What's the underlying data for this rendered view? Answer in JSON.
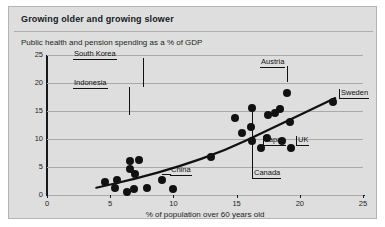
{
  "card": {
    "title": "Growing older and growing slower",
    "subtitle": "Public health and pension spending as a % of GDP",
    "bg_color": "#dedede",
    "ink_color": "#111111"
  },
  "chart_data": {
    "type": "scatter",
    "title": "Growing older and growing slower",
    "subtitle": "Public health and pension spending as a % of GDP",
    "xlabel": "% of population over 60 years old",
    "ylabel": "Public health and pension spending as a % of GDP",
    "xlim": [
      0,
      25
    ],
    "ylim": [
      0,
      25
    ],
    "xticks": [
      "0",
      "5",
      "10",
      "15",
      "20",
      "25"
    ],
    "yticks": [
      "0",
      "5",
      "10",
      "15",
      "20",
      "25"
    ],
    "grid": "horizontal",
    "legend": "none",
    "points": [
      {
        "x": 4.6,
        "y": 2.4
      },
      {
        "x": 5.5,
        "y": 2.6
      },
      {
        "x": 5.4,
        "y": 1.2
      },
      {
        "x": 6.3,
        "y": 0.5
      },
      {
        "x": 6.9,
        "y": 1.1
      },
      {
        "x": 6.6,
        "y": 6.0,
        "label": "South Korea"
      },
      {
        "x": 7.3,
        "y": 6.2
      },
      {
        "x": 6.6,
        "y": 4.6
      },
      {
        "x": 7.0,
        "y": 3.7
      },
      {
        "x": 7.9,
        "y": 1.2
      },
      {
        "x": 9.1,
        "y": 2.6
      },
      {
        "x": 10.0,
        "y": 1.0,
        "label": "China"
      },
      {
        "x": 13.0,
        "y": 6.8
      },
      {
        "x": 16.2,
        "y": 9.6,
        "label": "Canada"
      },
      {
        "x": 16.9,
        "y": 8.4,
        "label": "Japan"
      },
      {
        "x": 15.4,
        "y": 11.1
      },
      {
        "x": 14.9,
        "y": 13.7
      },
      {
        "x": 16.1,
        "y": 12.2
      },
      {
        "x": 16.2,
        "y": 15.6
      },
      {
        "x": 17.5,
        "y": 14.2
      },
      {
        "x": 18.0,
        "y": 14.6
      },
      {
        "x": 18.4,
        "y": 15.3
      },
      {
        "x": 17.4,
        "y": 10.2
      },
      {
        "x": 18.6,
        "y": 9.6
      },
      {
        "x": 19.2,
        "y": 13.0
      },
      {
        "x": 19.3,
        "y": 8.4,
        "label": "UK"
      },
      {
        "x": 19.0,
        "y": 18.3,
        "label": "Austria"
      },
      {
        "x": 22.6,
        "y": 16.6,
        "label": "Sweden"
      }
    ],
    "trend_line": {
      "style": "solid-thick",
      "color": "#111111",
      "points": [
        [
          3.9,
          1.3
        ],
        [
          7.0,
          2.9
        ],
        [
          10.5,
          5.1
        ],
        [
          14.0,
          7.9
        ],
        [
          17.5,
          11.6
        ],
        [
          21.0,
          15.4
        ],
        [
          22.8,
          17.3
        ]
      ]
    },
    "annotations": [
      {
        "label": "South Korea",
        "anchor": {
          "x": 6.6,
          "y": 6.0
        }
      },
      {
        "label": "Indonesia",
        "anchor": {
          "x": 7.0,
          "y": 3.7
        }
      },
      {
        "label": "China",
        "anchor": {
          "x": 10.0,
          "y": 1.0
        }
      },
      {
        "label": "Austria",
        "anchor": {
          "x": 19.0,
          "y": 18.3
        }
      },
      {
        "label": "Sweden",
        "anchor": {
          "x": 22.6,
          "y": 16.6
        }
      },
      {
        "label": "UK",
        "anchor": {
          "x": 19.3,
          "y": 8.4
        }
      },
      {
        "label": "Japan",
        "anchor": {
          "x": 16.9,
          "y": 8.4
        }
      },
      {
        "label": "Canada",
        "anchor": {
          "x": 16.2,
          "y": 9.6
        }
      }
    ]
  },
  "annotation_labels": {
    "south_korea": "South Korea",
    "indonesia": "Indonesia",
    "china": "China",
    "austria": "Austria",
    "sweden": "Sweden",
    "uk": "UK",
    "japan": "Japan",
    "canada": "Canada"
  },
  "axes": {
    "x_title": "% of population over 60 years old",
    "y_ticks": [
      "25",
      "20",
      "15",
      "10",
      "5",
      "0"
    ],
    "x_ticks": [
      "0",
      "5",
      "10",
      "15",
      "20",
      "25"
    ]
  }
}
